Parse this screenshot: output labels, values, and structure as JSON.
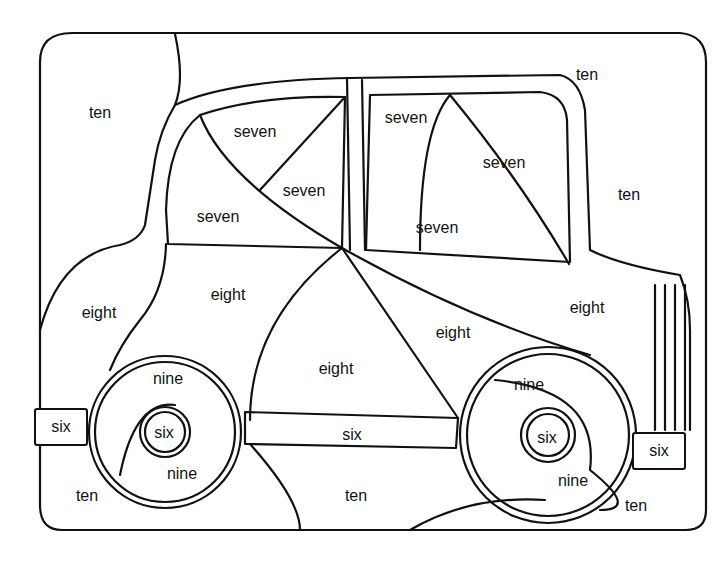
{
  "regions": [
    {
      "id": "bg-top-left",
      "label": "ten",
      "x": 100,
      "y": 113
    },
    {
      "id": "bg-top-right",
      "label": "ten",
      "x": 587,
      "y": 75
    },
    {
      "id": "bg-right",
      "label": "ten",
      "x": 629,
      "y": 195
    },
    {
      "id": "window-left-top",
      "label": "seven",
      "x": 255,
      "y": 132
    },
    {
      "id": "window-left-mid",
      "label": "seven",
      "x": 304,
      "y": 191
    },
    {
      "id": "window-left-bottom",
      "label": "seven",
      "x": 218,
      "y": 217
    },
    {
      "id": "window-right-top",
      "label": "seven",
      "x": 406,
      "y": 118
    },
    {
      "id": "window-right-mid",
      "label": "seven",
      "x": 504,
      "y": 163
    },
    {
      "id": "window-right-bottom",
      "label": "seven",
      "x": 437,
      "y": 228
    },
    {
      "id": "body-left-outer",
      "label": "eight",
      "x": 99,
      "y": 313
    },
    {
      "id": "body-left",
      "label": "eight",
      "x": 228,
      "y": 295
    },
    {
      "id": "body-center",
      "label": "eight",
      "x": 336,
      "y": 369
    },
    {
      "id": "body-mid-right",
      "label": "eight",
      "x": 453,
      "y": 333
    },
    {
      "id": "body-right",
      "label": "eight",
      "x": 587,
      "y": 308
    },
    {
      "id": "wheel-left-top",
      "label": "nine",
      "x": 168,
      "y": 379
    },
    {
      "id": "wheel-left-bottom",
      "label": "nine",
      "x": 182,
      "y": 474
    },
    {
      "id": "wheel-right-top",
      "label": "nine",
      "x": 529,
      "y": 385
    },
    {
      "id": "wheel-right-bottom",
      "label": "nine",
      "x": 573,
      "y": 481
    },
    {
      "id": "hub-left",
      "label": "six",
      "x": 164,
      "y": 433
    },
    {
      "id": "hub-right",
      "label": "six",
      "x": 547,
      "y": 438
    },
    {
      "id": "rocker",
      "label": "six",
      "x": 352,
      "y": 435
    },
    {
      "id": "ground-left",
      "label": "ten",
      "x": 87,
      "y": 496
    },
    {
      "id": "ground-center",
      "label": "ten",
      "x": 356,
      "y": 496
    },
    {
      "id": "ground-right",
      "label": "ten",
      "x": 636,
      "y": 506
    }
  ],
  "bumpers": [
    {
      "id": "bumper-left",
      "label": "six"
    },
    {
      "id": "bumper-right",
      "label": "six"
    }
  ]
}
